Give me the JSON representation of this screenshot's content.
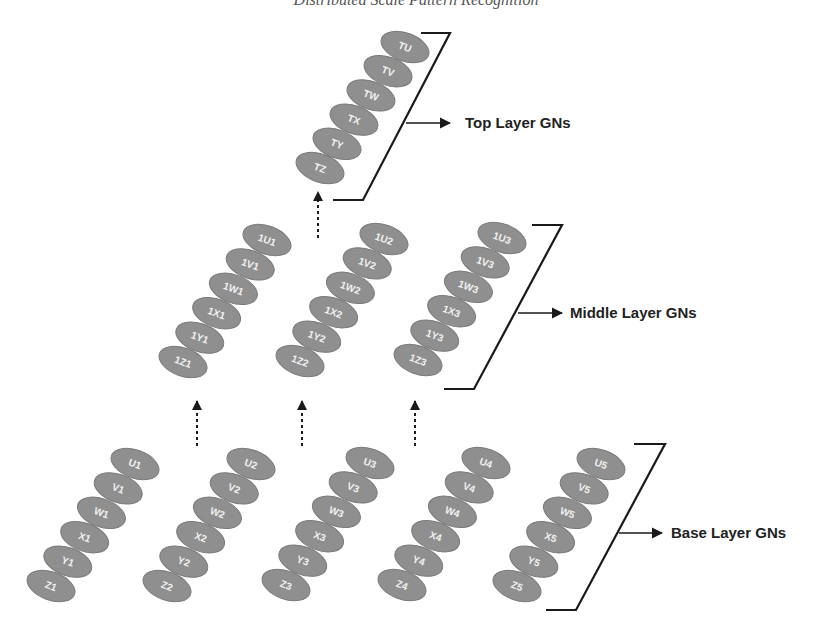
{
  "header": {
    "title": "Distributed Scale Pattern Recognition"
  },
  "colors": {
    "node_fill": "#8f8f8f",
    "node_stroke": "#7a7a7a",
    "node_text": "#f2f2f2",
    "line": "#1a1a1a",
    "label": "#222222"
  },
  "ellipse": {
    "rx": 25,
    "ry": 14,
    "rotate": 20
  },
  "layers": [
    {
      "id": "top",
      "label": "Top Layer GNs",
      "columns": [
        {
          "bottom": [
            320,
            168
          ],
          "top": [
            405,
            47
          ],
          "nodes": [
            "TZ",
            "TY",
            "TX",
            "TW",
            "TV",
            "TU"
          ]
        }
      ],
      "bracket": {
        "top": [
          [
            421,
            33
          ],
          [
            450,
            33
          ]
        ],
        "bottom": [
          [
            333,
            200
          ],
          [
            363,
            200
          ]
        ]
      },
      "arrow": {
        "from": [
          406,
          123
        ],
        "to": [
          450,
          123
        ]
      },
      "label_pos": [
        465,
        128
      ]
    },
    {
      "id": "middle",
      "label": "Middle Layer GNs",
      "columns": [
        {
          "bottom": [
            183,
            362
          ],
          "top": [
            267,
            240
          ],
          "nodes": [
            "1Z1",
            "1Y1",
            "1X1",
            "1W1",
            "1V1",
            "1U1"
          ]
        },
        {
          "bottom": [
            300,
            361
          ],
          "top": [
            384,
            239
          ],
          "nodes": [
            "1Z2",
            "1Y2",
            "1X2",
            "1W2",
            "1V2",
            "1U2"
          ]
        },
        {
          "bottom": [
            418,
            360
          ],
          "top": [
            502,
            238
          ],
          "nodes": [
            "1Z3",
            "1Y3",
            "1X3",
            "1W3",
            "1V3",
            "1U3"
          ]
        }
      ],
      "bracket": {
        "top": [
          [
            532,
            225
          ],
          [
            562,
            225
          ]
        ],
        "bottom": [
          [
            444,
            389
          ],
          [
            474,
            389
          ]
        ]
      },
      "arrow": {
        "from": [
          518,
          313
        ],
        "to": [
          562,
          313
        ]
      },
      "label_pos": [
        570,
        318
      ]
    },
    {
      "id": "base",
      "label": "Base Layer GNs",
      "columns": [
        {
          "bottom": [
            51,
            586
          ],
          "top": [
            135,
            464
          ],
          "nodes": [
            "Z1",
            "Y1",
            "X1",
            "W1",
            "V1",
            "U1"
          ]
        },
        {
          "bottom": [
            167,
            586
          ],
          "top": [
            251,
            464
          ],
          "nodes": [
            "Z2",
            "Y2",
            "X2",
            "W2",
            "V2",
            "U2"
          ]
        },
        {
          "bottom": [
            286,
            585
          ],
          "top": [
            370,
            463
          ],
          "nodes": [
            "Z3",
            "Y3",
            "X3",
            "W3",
            "V3",
            "U3"
          ]
        },
        {
          "bottom": [
            402,
            585
          ],
          "top": [
            486,
            463
          ],
          "nodes": [
            "Z4",
            "Y4",
            "X4",
            "W4",
            "V4",
            "U4"
          ]
        },
        {
          "bottom": [
            517,
            586
          ],
          "top": [
            601,
            464
          ],
          "nodes": [
            "Z5",
            "Y5",
            "X5",
            "W5",
            "V5",
            "U5"
          ]
        }
      ],
      "bracket": {
        "top": [
          [
            634,
            444
          ],
          [
            665,
            444
          ]
        ],
        "bottom": [
          [
            546,
            610
          ],
          [
            576,
            610
          ]
        ]
      },
      "arrow": {
        "from": [
          619,
          533
        ],
        "to": [
          662,
          533
        ]
      },
      "label_pos": [
        671,
        538
      ]
    }
  ],
  "dashed_arrows": [
    {
      "x": 318,
      "y_top": 190,
      "y_bottom": 238
    },
    {
      "x": 197,
      "y_top": 399,
      "y_bottom": 446
    },
    {
      "x": 302,
      "y_top": 399,
      "y_bottom": 446
    },
    {
      "x": 415,
      "y_top": 399,
      "y_bottom": 446
    }
  ]
}
